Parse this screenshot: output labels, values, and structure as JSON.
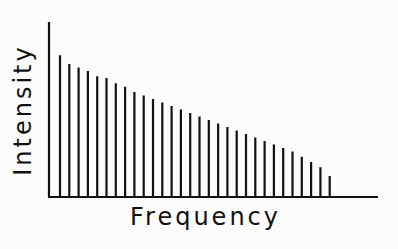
{
  "chart_data": {
    "type": "bar",
    "style": "line-spectrum (thin vertical lines, no ticks)",
    "title": "",
    "xlabel": "Frequency",
    "ylabel": "Intensity",
    "grid": false,
    "legend": null,
    "axis_ticks": false,
    "ylim": [
      0,
      100
    ],
    "x": [
      1,
      2,
      3,
      4,
      5,
      6,
      7,
      8,
      9,
      10,
      11,
      12,
      13,
      14,
      15,
      16,
      17,
      18,
      19,
      20,
      21,
      22,
      23,
      24,
      25,
      26,
      27,
      28,
      29,
      30
    ],
    "values": [
      81,
      76,
      74,
      72,
      69,
      68,
      65,
      63,
      60,
      58,
      56,
      54,
      52,
      50,
      48,
      46,
      44,
      42,
      40,
      38,
      36,
      34,
      32,
      30,
      28,
      26,
      23,
      20,
      17,
      12
    ],
    "colors": {
      "line": "#111111",
      "background": "#fbfbfa"
    }
  },
  "labels": {
    "x_axis": "Frequency",
    "y_axis": "Intensity"
  }
}
